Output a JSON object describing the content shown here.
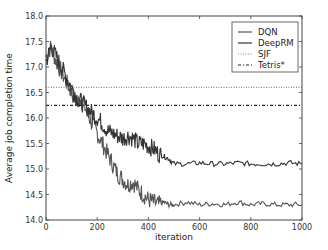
{
  "chart_data": {
    "type": "line",
    "title": "",
    "xlabel": "iteration",
    "ylabel": "Average job completion time",
    "xlim": [
      0,
      1000
    ],
    "ylim": [
      14.0,
      18.0
    ],
    "xticks": [
      "0",
      "200",
      "400",
      "600",
      "800",
      "1000"
    ],
    "yticks": [
      "14.0",
      "14.5",
      "15.0",
      "15.5",
      "16.0",
      "16.5",
      "17.0",
      "17.5",
      "18.0"
    ],
    "grid": false,
    "legend_position": "upper right",
    "series": [
      {
        "name": "DQN",
        "style": "solid",
        "color": "#555555",
        "x": [
          0,
          20,
          40,
          60,
          80,
          100,
          120,
          140,
          160,
          180,
          200,
          220,
          240,
          260,
          280,
          300,
          320,
          340,
          360,
          380,
          400,
          420,
          440,
          460,
          480,
          500,
          550,
          600,
          650,
          700,
          750,
          800,
          850,
          900,
          950,
          1000
        ],
        "values": [
          17.2,
          17.4,
          17.1,
          16.9,
          16.7,
          16.5,
          16.3,
          16.4,
          16.1,
          15.9,
          15.7,
          15.5,
          15.3,
          15.1,
          14.9,
          14.8,
          14.7,
          14.75,
          14.6,
          14.5,
          14.4,
          14.35,
          14.3,
          14.35,
          14.3,
          14.3,
          14.35,
          14.3,
          14.32,
          14.3,
          14.35,
          14.3,
          14.32,
          14.3,
          14.3,
          14.3
        ]
      },
      {
        "name": "DeepRM",
        "style": "solid",
        "color": "#333333",
        "x": [
          0,
          20,
          40,
          60,
          80,
          100,
          120,
          140,
          160,
          180,
          200,
          220,
          240,
          260,
          280,
          300,
          320,
          340,
          360,
          380,
          400,
          420,
          440,
          460,
          480,
          500,
          550,
          600,
          650,
          700,
          750,
          800,
          850,
          900,
          950,
          1000
        ],
        "values": [
          17.1,
          17.4,
          17.2,
          17.0,
          16.8,
          16.6,
          16.4,
          16.3,
          16.2,
          16.1,
          16.0,
          15.9,
          15.75,
          15.7,
          15.65,
          15.6,
          15.65,
          15.6,
          15.5,
          15.5,
          15.45,
          15.4,
          15.3,
          15.25,
          15.2,
          15.1,
          15.1,
          15.12,
          15.1,
          15.1,
          15.12,
          15.1,
          15.1,
          15.1,
          15.12,
          15.1
        ]
      },
      {
        "name": "SJF",
        "style": "dotted",
        "color": "#888888",
        "x": [
          0,
          1000
        ],
        "values": [
          16.6,
          16.6
        ]
      },
      {
        "name": "Tetris*",
        "style": "dashdot",
        "color": "#222222",
        "x": [
          0,
          1000
        ],
        "values": [
          16.25,
          16.25
        ]
      }
    ]
  }
}
